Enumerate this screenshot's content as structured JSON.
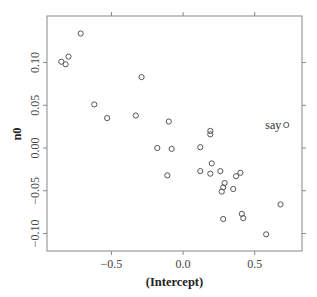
{
  "chart_data": {
    "type": "scatter",
    "title": "",
    "xlabel": "(Intercept)",
    "ylabel": "n0",
    "xlim": [
      -0.95,
      0.83
    ],
    "ylim": [
      -0.1205,
      0.1545
    ],
    "x_ticks": [
      -0.5,
      0.0,
      0.5
    ],
    "x_tick_labels": [
      "−0.5",
      "0.0",
      "0.5"
    ],
    "y_ticks": [
      -0.1,
      -0.05,
      0.0,
      0.05,
      0.1
    ],
    "y_tick_labels": [
      "−0.10",
      "−0.05",
      "0.00",
      "0.05",
      "0.10"
    ],
    "grid": false,
    "legend": null,
    "marker": "open-circle",
    "colors": {
      "marker": "#555555",
      "frame": "#888888",
      "text": "#333333"
    },
    "points": [
      {
        "x": -0.715,
        "y": 0.134
      },
      {
        "x": -0.8,
        "y": 0.107
      },
      {
        "x": -0.85,
        "y": 0.101
      },
      {
        "x": -0.82,
        "y": 0.098
      },
      {
        "x": -0.29,
        "y": 0.083
      },
      {
        "x": -0.62,
        "y": 0.051
      },
      {
        "x": -0.53,
        "y": 0.035
      },
      {
        "x": -0.33,
        "y": 0.038
      },
      {
        "x": -0.1,
        "y": 0.031
      },
      {
        "x": 0.19,
        "y": 0.02
      },
      {
        "x": 0.19,
        "y": 0.016
      },
      {
        "x": -0.18,
        "y": 0.0
      },
      {
        "x": -0.08,
        "y": -0.001
      },
      {
        "x": 0.12,
        "y": 0.001
      },
      {
        "x": 0.72,
        "y": 0.027,
        "label": "say"
      },
      {
        "x": 0.2,
        "y": -0.018
      },
      {
        "x": 0.12,
        "y": -0.027
      },
      {
        "x": 0.19,
        "y": -0.03
      },
      {
        "x": 0.26,
        "y": -0.027
      },
      {
        "x": -0.11,
        "y": -0.032
      },
      {
        "x": 0.37,
        "y": -0.033
      },
      {
        "x": 0.4,
        "y": -0.029
      },
      {
        "x": 0.29,
        "y": -0.041
      },
      {
        "x": 0.28,
        "y": -0.046
      },
      {
        "x": 0.27,
        "y": -0.051
      },
      {
        "x": 0.35,
        "y": -0.048
      },
      {
        "x": 0.68,
        "y": -0.066
      },
      {
        "x": 0.41,
        "y": -0.077
      },
      {
        "x": 0.42,
        "y": -0.082
      },
      {
        "x": 0.28,
        "y": -0.083
      },
      {
        "x": 0.58,
        "y": -0.101
      }
    ],
    "annotations": [
      {
        "text": "say",
        "x": 0.72,
        "y": 0.027,
        "position": "left"
      }
    ]
  }
}
